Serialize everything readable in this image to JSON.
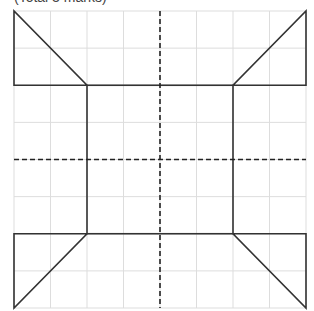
{
  "caption": "(Total 3 marks)",
  "grid": {
    "columns": 8,
    "rows": 8,
    "left": 14,
    "top": 11,
    "right": 306,
    "bottom": 308,
    "grid_color": "#dddddd",
    "line_color": "#333333",
    "symmetry_line_color": "#222222"
  },
  "symmetry_lines": [
    {
      "name": "vertical-mirror-line",
      "orientation": "vertical",
      "position": 4
    },
    {
      "name": "horizontal-mirror-line",
      "orientation": "horizontal",
      "position": 4
    }
  ],
  "shapes": [
    {
      "name": "center-square",
      "type": "square",
      "cells": [
        [
          2,
          2
        ],
        [
          6,
          6
        ]
      ]
    },
    {
      "name": "top-left-triangle",
      "points": [
        [
          0,
          0
        ],
        [
          0,
          2
        ],
        [
          2,
          2
        ]
      ]
    },
    {
      "name": "top-right-triangle",
      "points": [
        [
          8,
          0
        ],
        [
          8,
          2
        ],
        [
          6,
          2
        ]
      ]
    },
    {
      "name": "bottom-left-triangle",
      "points": [
        [
          0,
          6
        ],
        [
          2,
          6
        ],
        [
          0,
          8
        ]
      ]
    },
    {
      "name": "bottom-right-triangle",
      "points": [
        [
          6,
          6
        ],
        [
          8,
          6
        ],
        [
          8,
          8
        ]
      ]
    }
  ]
}
